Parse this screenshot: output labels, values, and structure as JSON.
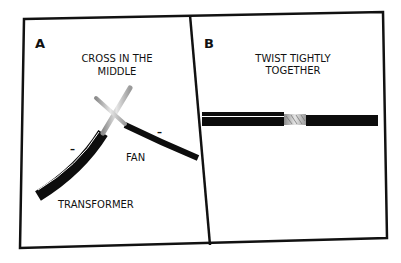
{
  "panels": [
    {
      "letter": "A",
      "caption_line1": "CROSS IN THE",
      "caption_line2": "MIDDLE",
      "labels": {
        "fan": "FAN",
        "transformer": "TRANSFORMER",
        "polarity_left": "–",
        "polarity_right": "–"
      }
    },
    {
      "letter": "B",
      "caption_line1": "TWIST TIGHTLY",
      "caption_line2": "TOGETHER"
    }
  ],
  "colors": {
    "frame": "#111111",
    "wire_insulation": "#0d0d0d",
    "bare_wire": "#b8b8b8",
    "background": "#ffffff"
  }
}
